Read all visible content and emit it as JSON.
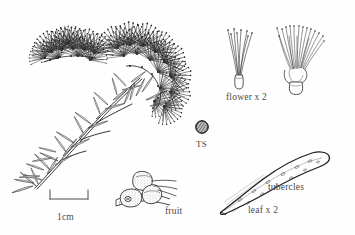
{
  "plate": {
    "kind": "botanical-line-illustration",
    "subject": "Melaleuca-type shrub: flowering branchlet with dissected details",
    "background_color": "#fefefe",
    "ink_color": "#2b2b2b",
    "label_color": "#4a4a4a"
  },
  "labels": {
    "flower": "flower x 2",
    "ts": "TS",
    "fruit": "fruit",
    "tubercles": "tubercles",
    "leaf": "leaf x 2",
    "scale": "1cm"
  },
  "scale_bar": {
    "caption": "1cm",
    "length_px": 38,
    "x_start": 50,
    "x_end": 88,
    "y": 197
  },
  "figures": [
    {
      "name": "flowering-branch",
      "caption": "",
      "magnification": "x 1",
      "description": "Leafy branchlet bearing two dense brush-like inflorescences of fine radiating stamens; narrow linear leaves along the lower stem."
    },
    {
      "name": "single-flower",
      "caption": "flower x 2",
      "magnification": "x 2",
      "description": "Single flower with a bundle of splayed stamens arising from a narrow tubular hypanthium."
    },
    {
      "name": "flower-cluster",
      "caption": "flower x 2",
      "magnification": "x 2",
      "description": "Flower with many stamens and anthers radiating from a bracteate bud base on a short hypanthium."
    },
    {
      "name": "leaf-transverse-section",
      "caption": "TS",
      "magnification": "",
      "description": "Small cross-hatched circular transverse section of the leaf."
    },
    {
      "name": "fruit-cluster",
      "caption": "fruit",
      "magnification": "",
      "description": "Three stippled woody capsules clustered on a short length of stem."
    },
    {
      "name": "leaf-detail",
      "caption": "leaf x 2",
      "magnification": "x 2",
      "description": "Elongated narrow leaf broadest near the apex, tapering to a pointed base, with marginal hairs and tubercles on the surface.",
      "annotation": "tubercles"
    }
  ]
}
